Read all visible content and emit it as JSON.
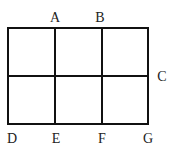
{
  "diagram": {
    "type": "grid",
    "rows": 2,
    "columns": 3,
    "line_color": "#111111",
    "labels": [
      {
        "text": "A",
        "x": 55,
        "y": 22
      },
      {
        "text": "B",
        "x": 100,
        "y": 22
      },
      {
        "text": "C",
        "x": 162,
        "y": 81
      },
      {
        "text": "D",
        "x": 10,
        "y": 143
      },
      {
        "text": "E",
        "x": 56,
        "y": 143
      },
      {
        "text": "F",
        "x": 102,
        "y": 143
      },
      {
        "text": "G",
        "x": 148,
        "y": 143
      }
    ]
  }
}
